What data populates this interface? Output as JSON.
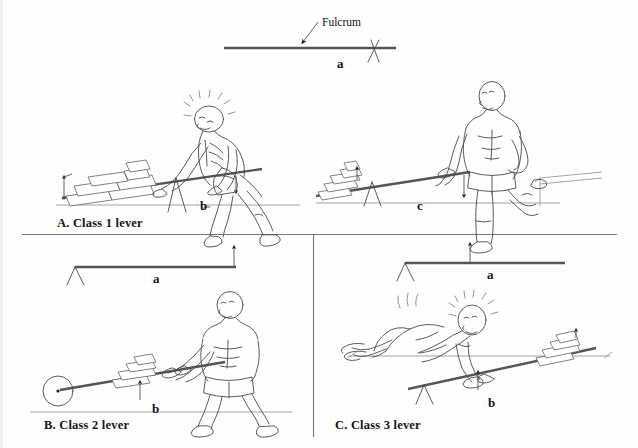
{
  "figure": {
    "title_annotation": "Fulcrum",
    "width": 638,
    "height": 448,
    "background_color": "#fefefe",
    "ink_color": "#3a3a3a",
    "text_color": "#151515"
  },
  "top_diagram": {
    "name": "schematic lever with fulcrum",
    "fulcrum_label": "Fulcrum",
    "bar_label": "a"
  },
  "panels": [
    {
      "id": "A",
      "caption": "A. Class 1 lever",
      "letters": [
        "b"
      ],
      "description": "Man pushing down on a lever bar over a triangular fulcrum to lift a stack of bricks",
      "load": "stack of bricks",
      "fulcrum": "triangle support under middle of bar",
      "effort": "man pressing down with both hands"
    },
    {
      "id": "A2",
      "caption": "",
      "letters": [
        "c"
      ],
      "description": "Man standing with foot raised on a ledge, holding the end of the lever bar, bricks on the far low end",
      "load": "stack of bricks",
      "fulcrum": "triangle support near bricks",
      "effort": "man's hand at the bar end"
    },
    {
      "id": "B",
      "caption": "B. Class 2 lever",
      "letters": [
        "a",
        "b"
      ],
      "description": "Man walking and pulling a wheelbarrow-like lever; wheel at the far end acts as the fulcrum with bricks in the middle",
      "load": "stack of bricks at the middle",
      "fulcrum": "wheel at the far left end",
      "effort": "man pulling up on the handles"
    },
    {
      "id": "C",
      "caption": "C. Class 3 lever",
      "letters": [
        "a",
        "b"
      ],
      "description": "Man lying prone on the ground pushing up the middle of a lever bar; bricks rest on the far raised end and a triangular fulcrum sits at the near low end",
      "load": "stack of bricks on the raised end",
      "fulcrum": "triangle support at the lower left end",
      "effort": "man's hands at the middle of the bar"
    }
  ],
  "labels": {
    "fulcrum": "Fulcrum",
    "a": "a",
    "b": "b",
    "c": "c",
    "caption_a": "A. Class 1 lever",
    "caption_b": "B. Class 2 lever",
    "caption_c": "C. Class 3 lever"
  }
}
